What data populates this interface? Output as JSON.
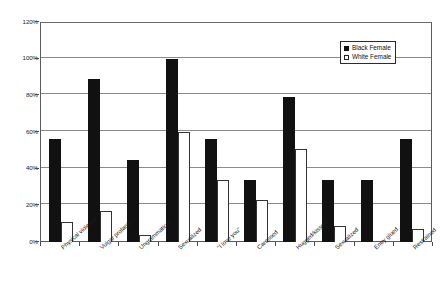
{
  "chart_data": {
    "type": "bar",
    "title": "",
    "xlabel": "",
    "ylabel": "",
    "ylim": [
      0,
      120
    ],
    "ytick_labels": [
      "0%",
      "20%",
      "40%",
      "60%",
      "80%",
      "100%",
      "120%"
    ],
    "ytick_values": [
      0,
      20,
      40,
      60,
      80,
      100,
      120
    ],
    "grid": true,
    "legend_position": "upper-right",
    "categories": [
      "Physical violence",
      "Vulgar profanity",
      "Ungrammatical",
      "Sexualized",
      "\"I love you\"",
      "Caressed",
      "Hugged/kissed",
      "Sexualized",
      "Entry glued",
      "Restrained"
    ],
    "series": [
      {
        "name": "Black Female",
        "color": "#111111",
        "values": [
          56,
          89,
          45,
          100,
          56,
          34,
          79,
          34,
          34,
          56
        ]
      },
      {
        "name": "White Female",
        "color": "#ffffff",
        "values": [
          11,
          17,
          4,
          60,
          34,
          23,
          51,
          9,
          0,
          7
        ]
      }
    ]
  },
  "legend": {
    "items": [
      {
        "label": "Black Female",
        "swatch": "filled-square-icon"
      },
      {
        "label": "White Female",
        "swatch": "hollow-square-icon"
      }
    ]
  }
}
